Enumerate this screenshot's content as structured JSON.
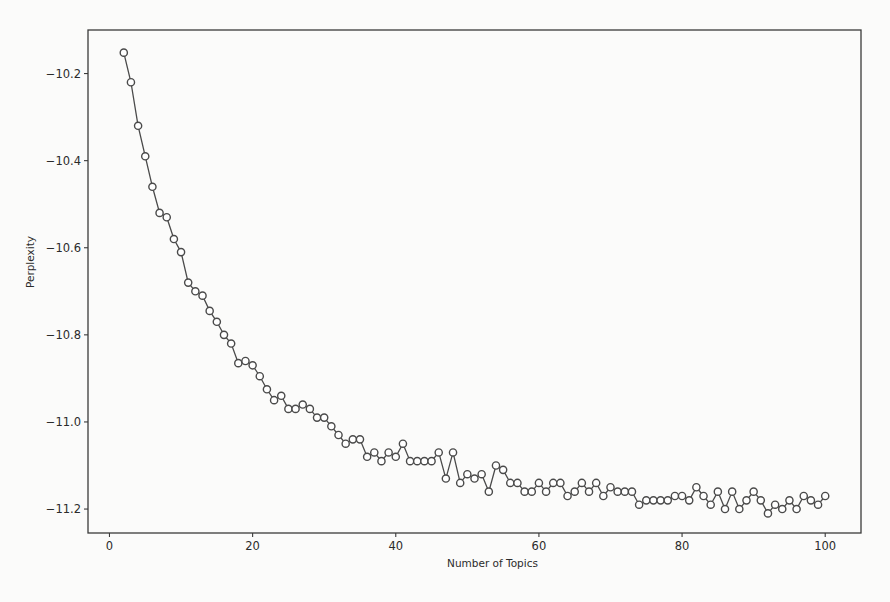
{
  "chart_data": {
    "type": "line",
    "title": "",
    "xlabel": "Number of Topics",
    "ylabel": "Perplexity",
    "xlim": [
      -3,
      105
    ],
    "ylim": [
      -11.255,
      -10.1
    ],
    "xticks": [
      0,
      20,
      40,
      60,
      80,
      100
    ],
    "yticks": [
      -10.2,
      -10.4,
      -10.6,
      -10.8,
      -11.0,
      -11.2
    ],
    "ytick_labels": [
      "−10.2",
      "−10.4",
      "−10.6",
      "−10.8",
      "−11.0",
      "−11.2"
    ],
    "xtick_labels": [
      "0",
      "20",
      "40",
      "60",
      "80",
      "100"
    ],
    "grid": false,
    "legend": null,
    "marker": "open-circle",
    "line_color": "#4a4a4a",
    "series": [
      {
        "name": "Perplexity",
        "x": [
          2,
          3,
          4,
          5,
          6,
          7,
          8,
          9,
          10,
          11,
          12,
          13,
          14,
          15,
          16,
          17,
          18,
          19,
          20,
          21,
          22,
          23,
          24,
          25,
          26,
          27,
          28,
          29,
          30,
          31,
          32,
          33,
          34,
          35,
          36,
          37,
          38,
          39,
          40,
          41,
          42,
          43,
          44,
          45,
          46,
          47,
          48,
          49,
          50,
          51,
          52,
          53,
          54,
          55,
          56,
          57,
          58,
          59,
          60,
          61,
          62,
          63,
          64,
          65,
          66,
          67,
          68,
          69,
          70,
          71,
          72,
          73,
          74,
          75,
          76,
          77,
          78,
          79,
          80,
          81,
          82,
          83,
          84,
          85,
          86,
          87,
          88,
          89,
          90,
          91,
          92,
          93,
          94,
          95,
          96,
          97,
          98,
          99,
          100
        ],
        "values": [
          -10.152,
          -10.22,
          -10.32,
          -10.39,
          -10.46,
          -10.52,
          -10.53,
          -10.58,
          -10.61,
          -10.68,
          -10.7,
          -10.71,
          -10.745,
          -10.77,
          -10.8,
          -10.82,
          -10.865,
          -10.86,
          -10.87,
          -10.895,
          -10.925,
          -10.95,
          -10.94,
          -10.97,
          -10.97,
          -10.96,
          -10.97,
          -10.99,
          -10.99,
          -11.01,
          -11.03,
          -11.05,
          -11.04,
          -11.04,
          -11.08,
          -11.07,
          -11.09,
          -11.07,
          -11.08,
          -11.05,
          -11.09,
          -11.09,
          -11.09,
          -11.09,
          -11.07,
          -11.13,
          -11.07,
          -11.14,
          -11.12,
          -11.13,
          -11.12,
          -11.16,
          -11.1,
          -11.11,
          -11.14,
          -11.14,
          -11.16,
          -11.16,
          -11.14,
          -11.16,
          -11.14,
          -11.14,
          -11.17,
          -11.16,
          -11.14,
          -11.16,
          -11.14,
          -11.17,
          -11.15,
          -11.16,
          -11.16,
          -11.16,
          -11.19,
          -11.18,
          -11.18,
          -11.18,
          -11.18,
          -11.17,
          -11.17,
          -11.18,
          -11.15,
          -11.17,
          -11.19,
          -11.16,
          -11.2,
          -11.16,
          -11.2,
          -11.18,
          -11.16,
          -11.18,
          -11.21,
          -11.19,
          -11.2,
          -11.18,
          -11.2,
          -11.17,
          -11.18,
          -11.19,
          -11.17
        ]
      }
    ]
  },
  "layout": {
    "plot_left": 88,
    "plot_top": 30,
    "plot_right": 861,
    "plot_bottom": 533
  }
}
